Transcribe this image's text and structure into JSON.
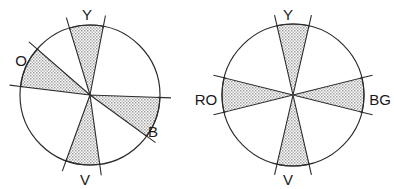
{
  "figure": {
    "title": "",
    "background_color": "#ffffff",
    "stroke_color": "#2b2b2b",
    "wedge_fill_color": "#c9c9c9",
    "label_color": "#1a1a1a"
  },
  "chart_data": {
    "type": "pie",
    "title": "",
    "subtitle": "",
    "xlabel": "",
    "ylabel": "",
    "legend_position": "none",
    "grid": false,
    "panels": [
      {
        "name": "left-hue-circle",
        "center": [
          90,
          95
        ],
        "radius": 70,
        "wedges": [
          {
            "label": "Y",
            "center_angle_deg": 93,
            "half_width_deg": 14,
            "label_angle_deg": 93,
            "label_x": 87,
            "label_y": 16,
            "filled": true
          },
          {
            "label": "O",
            "center_angle_deg": 156,
            "half_width_deg": 17,
            "label_angle_deg": 163,
            "label_x": 21,
            "label_y": 62,
            "filled": true
          },
          {
            "label": "B",
            "center_angle_deg": -19,
            "half_width_deg": 17,
            "label_angle_deg": -27,
            "label_x": 153,
            "label_y": 133,
            "filled": true
          },
          {
            "label": "V",
            "center_angle_deg": -96,
            "half_width_deg": 14,
            "label_angle_deg": -96,
            "label_x": 85,
            "label_y": 181,
            "filled": true
          }
        ]
      },
      {
        "name": "right-hue-circle",
        "center": [
          293,
          95
        ],
        "radius": 71,
        "wedges": [
          {
            "label": "Y",
            "center_angle_deg": 90,
            "half_width_deg": 13,
            "label_angle_deg": 90,
            "label_x": 288,
            "label_y": 16,
            "filled": true
          },
          {
            "label": "RO",
            "center_angle_deg": 180,
            "half_width_deg": 14,
            "label_angle_deg": 180,
            "label_x": 206,
            "label_y": 101,
            "filled": true
          },
          {
            "label": "BG",
            "center_angle_deg": 0,
            "half_width_deg": 14,
            "label_angle_deg": 0,
            "label_x": 380,
            "label_y": 101,
            "filled": true
          },
          {
            "label": "V",
            "center_angle_deg": -90,
            "half_width_deg": 13,
            "label_angle_deg": -90,
            "label_x": 288,
            "label_y": 181,
            "filled": true
          }
        ]
      }
    ]
  }
}
